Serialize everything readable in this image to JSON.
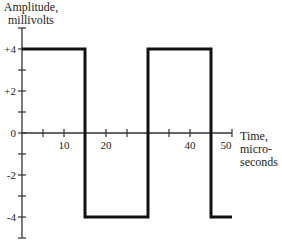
{
  "chart_data": {
    "type": "line",
    "title": "",
    "xlabel": "Time, micro-seconds",
    "ylabel": "Amplitude, millivolts",
    "xlabel_lines": [
      "Time,",
      "micro-",
      "seconds"
    ],
    "ylabel_lines": [
      "Amplitude,",
      "millivolts"
    ],
    "xlim": [
      0,
      50
    ],
    "ylim": [
      -5,
      5
    ],
    "x_ticks": [
      5,
      10,
      15,
      20,
      25,
      30,
      35,
      40,
      45,
      50
    ],
    "x_tick_labels": [
      {
        "value": 10,
        "label": "10"
      },
      {
        "value": 20,
        "label": "20"
      },
      {
        "value": 40,
        "label": "40"
      },
      {
        "value": 50,
        "label": "50"
      }
    ],
    "y_ticks": [
      -5,
      -4,
      -3,
      -2,
      -1,
      0,
      1,
      2,
      3,
      4,
      5
    ],
    "y_tick_labels": [
      {
        "value": 4,
        "label": "+4"
      },
      {
        "value": 2,
        "label": "+2"
      },
      {
        "value": 0,
        "label": "0"
      },
      {
        "value": -2,
        "label": "-2"
      },
      {
        "value": -4,
        "label": "-4"
      }
    ],
    "grid": false,
    "legend": null,
    "series": [
      {
        "name": "square wave",
        "style": "step",
        "color": "#111111",
        "x": [
          0,
          15,
          15,
          30,
          30,
          45,
          45,
          50
        ],
        "y": [
          4,
          4,
          -4,
          -4,
          4,
          4,
          -4,
          -4
        ]
      }
    ]
  },
  "colors": {
    "axis": "#333333",
    "wave": "#111111",
    "text": "#222222",
    "background": "#ffffff"
  }
}
